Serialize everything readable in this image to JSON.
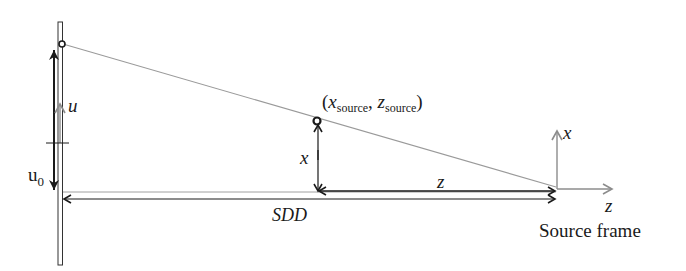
{
  "diagram": {
    "labels": {
      "u": "u",
      "u0_main": "u",
      "u0_sub": "0",
      "source_point_open": "(",
      "x_source_var": "x",
      "x_source_sub": "source",
      "comma": ",",
      "z_source_var": "z",
      "z_source_sub": "source",
      "source_point_close": ")",
      "x_distance": "x",
      "z_distance": "z",
      "sdd": "SDD",
      "frame_x_axis": "x",
      "frame_z_axis": "z",
      "frame_caption": "Source frame"
    },
    "colors": {
      "ink": "#1a1a1a",
      "gray_line": "#9a9a9a",
      "gray_axis": "#8c8c8c"
    }
  }
}
